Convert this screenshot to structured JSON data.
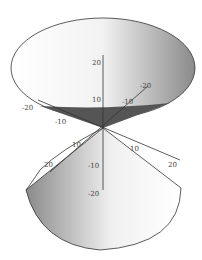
{
  "figure": {
    "type": "3d-surface",
    "axes": {
      "z": {
        "ticks": [
          "20",
          "10",
          "-10",
          "-20"
        ]
      },
      "x_back": {
        "ticks": [
          "-10",
          "-20"
        ]
      },
      "x_front": {
        "ticks": [
          "10",
          "20"
        ]
      },
      "y_left": {
        "ticks": [
          "-20",
          "-10"
        ]
      },
      "y_right": {
        "ticks": [
          "10",
          "20"
        ]
      }
    }
  },
  "colors": {
    "outline": "#333333",
    "shade_dark": "#444444",
    "shade_light": "#ffffff"
  }
}
